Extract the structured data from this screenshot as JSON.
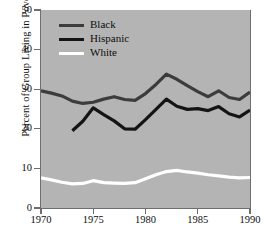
{
  "chart_data": {
    "type": "line",
    "title": "",
    "xlabel": "",
    "ylabel": "Percent of Group Living in Poverty",
    "xlim": [
      1970,
      1990
    ],
    "ylim": [
      0,
      50
    ],
    "grid": false,
    "legend_position": "upper-left-inside",
    "xticks": [
      1970,
      1975,
      1980,
      1985,
      1990
    ],
    "yticks": [
      0,
      10,
      20,
      30,
      40,
      50
    ],
    "plot_background": "#b4b4b4",
    "series": [
      {
        "name": "Black",
        "color": "#3c3c3c",
        "x": [
          1970,
          1971,
          1972,
          1973,
          1974,
          1975,
          1976,
          1977,
          1978,
          1979,
          1980,
          1981,
          1982,
          1983,
          1984,
          1985,
          1986,
          1987,
          1988,
          1989,
          1990
        ],
        "values": [
          29.6,
          29.0,
          28.3,
          27.0,
          26.4,
          26.7,
          27.5,
          28.1,
          27.4,
          27.2,
          28.9,
          31.2,
          33.8,
          32.5,
          30.9,
          29.4,
          28.1,
          29.6,
          27.9,
          27.4,
          29.3
        ]
      },
      {
        "name": "Hispanic",
        "color": "#141414",
        "x": [
          1973,
          1974,
          1975,
          1976,
          1977,
          1978,
          1979,
          1980,
          1981,
          1982,
          1983,
          1984,
          1985,
          1986,
          1987,
          1988,
          1989,
          1990
        ],
        "values": [
          19.5,
          21.9,
          25.3,
          23.6,
          22.0,
          20.0,
          19.9,
          22.3,
          24.9,
          27.5,
          25.7,
          24.9,
          25.1,
          24.6,
          25.6,
          23.8,
          23.0,
          24.7
        ]
      },
      {
        "name": "White",
        "color": "#ffffff",
        "x": [
          1970,
          1971,
          1972,
          1973,
          1974,
          1975,
          1976,
          1977,
          1978,
          1979,
          1980,
          1981,
          1982,
          1983,
          1984,
          1985,
          1986,
          1987,
          1988,
          1989,
          1990
        ],
        "values": [
          7.6,
          7.1,
          6.5,
          6.1,
          6.2,
          6.9,
          6.4,
          6.3,
          6.2,
          6.4,
          7.4,
          8.4,
          9.2,
          9.5,
          9.1,
          8.8,
          8.4,
          8.1,
          7.8,
          7.6,
          7.7
        ]
      }
    ]
  },
  "axes": {
    "ylabel": "Percent of Group Living in Poverty",
    "ytick_labels": [
      "50",
      "40",
      "30",
      "20",
      "10",
      "0"
    ],
    "xtick_labels": [
      "1970",
      "1975",
      "1980",
      "1985",
      "1990"
    ]
  },
  "legend": {
    "entries": [
      {
        "label": "Black",
        "color": "#3c3c3c"
      },
      {
        "label": "Hispanic",
        "color": "#141414"
      },
      {
        "label": "White",
        "color": "#ffffff"
      }
    ]
  }
}
